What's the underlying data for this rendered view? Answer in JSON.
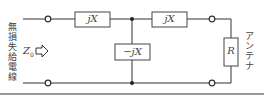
{
  "diagram": {
    "left_label": "無損失給電線",
    "impedance_label": "Z",
    "impedance_sub": "0",
    "arrow": "⇨",
    "components": {
      "series_left": "jX",
      "shunt": "−jX",
      "series_right": "jX",
      "load": "R"
    },
    "right_label": "アンテナ",
    "colors": {
      "wire": "#333333",
      "box_fill": "#ffffff",
      "rule": "#999999"
    }
  }
}
